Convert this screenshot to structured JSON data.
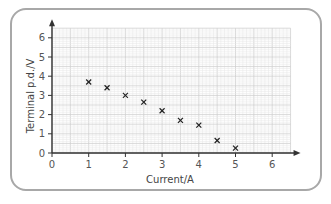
{
  "chart_data": {
    "type": "scatter",
    "title": "",
    "xlabel": "Current/A",
    "ylabel": "Terminal p.d./V",
    "xlim": [
      0,
      6.5
    ],
    "ylim": [
      0,
      6.5
    ],
    "x_ticks": [
      "0",
      "1",
      "2",
      "3",
      "4",
      "5",
      "6"
    ],
    "y_ticks": [
      "0",
      "1",
      "2",
      "3",
      "4",
      "5",
      "6"
    ],
    "grid": true,
    "marker": "x",
    "x": [
      1,
      1.5,
      2,
      2.5,
      3,
      3.5,
      4,
      4.5,
      5
    ],
    "y": [
      3.7,
      3.4,
      3.0,
      2.65,
      2.2,
      1.7,
      1.45,
      0.65,
      0.25
    ],
    "colors": {
      "grid_minor": "#e6e6e6",
      "grid_major": "#cfcfcf",
      "axis": "#333333",
      "marker": "#222222",
      "frame": "#a8a8a8"
    }
  }
}
